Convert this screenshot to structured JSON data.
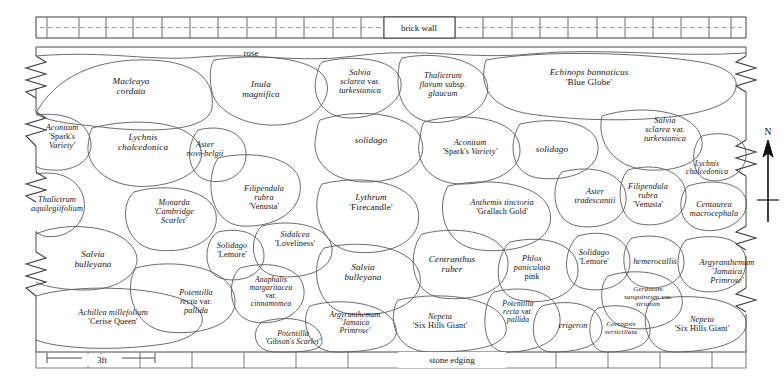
{
  "plan": {
    "title": "Herbaceous border planting plan",
    "annotations": {
      "wall": "brick wall",
      "rose": "rose",
      "edging": "stone edging"
    },
    "scale": {
      "label": "3ft"
    },
    "compass": {
      "label": "N"
    },
    "beds": [
      {
        "id": "aconitum-sparks-1",
        "genus": "Aconitum",
        "cultivar": "'Spark's Variety'",
        "lines": [
          "Aconitum",
          "'Spark's",
          "Variety'"
        ],
        "x": 62,
        "y": 137,
        "size": "sm"
      },
      {
        "id": "macleaya-cordata",
        "genus": "Macleaya cordata",
        "cultivar": "",
        "lines": [
          "Macleaya",
          "cordata"
        ],
        "x": 131,
        "y": 87,
        "size": ""
      },
      {
        "id": "lychnis-chalcedonica-1",
        "genus": "Lychnis chalcedonica",
        "cultivar": "",
        "lines": [
          "Lychnis",
          "chalcedonica"
        ],
        "x": 143,
        "y": 143,
        "size": ""
      },
      {
        "id": "thalictrum-aquilegiifolium",
        "genus": "Thalictrum aquilegiifolium",
        "cultivar": "",
        "lines": [
          "Thalictrum",
          "aquilegiifolium"
        ],
        "x": 57,
        "y": 205,
        "size": "sm"
      },
      {
        "id": "aster-novi-belgii",
        "genus": "Aster novi-belgii",
        "cultivar": "",
        "lines": [
          "Aster",
          "novi-belgii"
        ],
        "x": 205,
        "y": 150,
        "size": "sm"
      },
      {
        "id": "inula-magnifica",
        "genus": "Inula magnifica",
        "cultivar": "",
        "lines": [
          "Inula",
          "magnifica"
        ],
        "x": 261,
        "y": 90,
        "size": ""
      },
      {
        "id": "salvia-sclarea-turkestanica-1",
        "genus": "Salvia sclarea var. turkestanica",
        "cultivar": "",
        "lines": [
          "Salvia",
          "sclarea var.",
          "turkestanica"
        ],
        "x": 360,
        "y": 82,
        "size": "sm"
      },
      {
        "id": "thalictrum-flavum-glaucum",
        "genus": "Thalictrum flavum subsp. glaucum",
        "cultivar": "",
        "lines": [
          "Thalictrum",
          "flavum subsp.",
          "glaucum"
        ],
        "x": 443,
        "y": 85,
        "size": "sm"
      },
      {
        "id": "echinops-bannaticus",
        "genus": "Echinops bannaticus",
        "cultivar": "'Blue Globe'",
        "lines": [
          "Echinops bannaticus",
          "'Blue Globe'"
        ],
        "x": 589,
        "y": 78,
        "size": ""
      },
      {
        "id": "solidago-1",
        "genus": "solidago",
        "cultivar": "",
        "lines": [
          "solidago"
        ],
        "x": 371,
        "y": 141,
        "size": ""
      },
      {
        "id": "aconitum-sparks-2",
        "genus": "Aconitum",
        "cultivar": "'Spark's Variety'",
        "lines": [
          "Aconitum",
          "'Spark's Variety'"
        ],
        "x": 470,
        "y": 148,
        "size": "sm"
      },
      {
        "id": "solidago-2",
        "genus": "solidago",
        "cultivar": "",
        "lines": [
          "solidago"
        ],
        "x": 552,
        "y": 150,
        "size": ""
      },
      {
        "id": "salvia-sclarea-turkestanica-2",
        "genus": "Salvia sclarea var. turkestanica",
        "cultivar": "",
        "lines": [
          "Salvia",
          "sclarea var.",
          "turkestanica"
        ],
        "x": 665,
        "y": 130,
        "size": "sm"
      },
      {
        "id": "lychnis-chalcedonica-2",
        "genus": "Lychnis chalcedonica",
        "cultivar": "",
        "lines": [
          "Lychnis",
          "chalcedonica"
        ],
        "x": 707,
        "y": 168,
        "size": "xs"
      },
      {
        "id": "filipendula-venusta-1",
        "genus": "Filipendula rubra",
        "cultivar": "'Venusta'",
        "lines": [
          "Filipendula",
          "rubra",
          "'Venusta'"
        ],
        "x": 264,
        "y": 198,
        "size": "sm"
      },
      {
        "id": "monarda-cambridge-scarlet",
        "genus": "Monarda",
        "cultivar": "'Cambridge Scarlet'",
        "lines": [
          "Monarda",
          "'Cambridge",
          "Scarlet'"
        ],
        "x": 174,
        "y": 212,
        "size": "sm"
      },
      {
        "id": "lythrum-firecandle",
        "genus": "Lythrum",
        "cultivar": "'Firecandle'",
        "lines": [
          "Lythrum",
          "'Firecandle'"
        ],
        "x": 371,
        "y": 203,
        "size": ""
      },
      {
        "id": "anthemis-grallach-gold",
        "genus": "Anthemis tinctoria",
        "cultivar": "'Grallach Gold'",
        "lines": [
          "Anthemis tinctoria",
          "'Grallach Gold'"
        ],
        "x": 502,
        "y": 208,
        "size": "sm"
      },
      {
        "id": "aster-tradescantii",
        "genus": "Aster tradescantii",
        "cultivar": "",
        "lines": [
          "Aster",
          "tradescantii"
        ],
        "x": 595,
        "y": 197,
        "size": "sm"
      },
      {
        "id": "filipendula-venusta-2",
        "genus": "Filipendula rubra",
        "cultivar": "'Venusta'",
        "lines": [
          "Filipendula",
          "rubra",
          "'Venusta'"
        ],
        "x": 648,
        "y": 196,
        "size": "sm"
      },
      {
        "id": "centaurea-macrocephala",
        "genus": "Centaurea macrocephala",
        "cultivar": "",
        "lines": [
          "Centaurea",
          "macrocephala"
        ],
        "x": 714,
        "y": 210,
        "size": "sm"
      },
      {
        "id": "solidago-lemore-1",
        "genus": "Solidago",
        "cultivar": "'Lemore'",
        "lines": [
          "Solidago",
          "'Lemore'"
        ],
        "x": 232,
        "y": 251,
        "size": "sm"
      },
      {
        "id": "sidalcea-loveliness",
        "genus": "Sidalcea",
        "cultivar": "'Loveliness'",
        "lines": [
          "Sidalcea",
          "'Loveliness'"
        ],
        "x": 295,
        "y": 240,
        "size": "sm"
      },
      {
        "id": "salvia-bulleyana-1",
        "genus": "Salvia bulleyana",
        "cultivar": "",
        "lines": [
          "Salvia",
          "bulleyana"
        ],
        "x": 93,
        "y": 260,
        "size": ""
      },
      {
        "id": "salvia-bulleyana-2",
        "genus": "Salvia bulleyana",
        "cultivar": "",
        "lines": [
          "Salvia",
          "bulleyana"
        ],
        "x": 363,
        "y": 273,
        "size": ""
      },
      {
        "id": "centranthus-ruber",
        "genus": "Centranthus ruber",
        "cultivar": "",
        "lines": [
          "Centranthus",
          "ruber"
        ],
        "x": 452,
        "y": 265,
        "size": ""
      },
      {
        "id": "phlox-paniculata-pink",
        "genus": "Phlox paniculata",
        "cultivar": "pink",
        "lines": [
          "Phlox",
          "paniculata",
          "pink"
        ],
        "x": 532,
        "y": 268,
        "size": "sm"
      },
      {
        "id": "solidago-lemore-2",
        "genus": "Solidago",
        "cultivar": "'Lemore'",
        "lines": [
          "Solidago",
          "'Lemore'"
        ],
        "x": 594,
        "y": 258,
        "size": "sm"
      },
      {
        "id": "hemerocallis",
        "genus": "hemerocallis",
        "cultivar": "",
        "lines": [
          "hemerocallis"
        ],
        "x": 655,
        "y": 262,
        "size": "sm"
      },
      {
        "id": "argyranthemum-jamaica-primrose-2",
        "genus": "Argyranthemum",
        "cultivar": "'Jamaica Primrose'",
        "lines": [
          "Argyranthemum",
          "'Jamaica",
          "Primrose'"
        ],
        "x": 727,
        "y": 272,
        "size": "sm"
      },
      {
        "id": "anaphalis-margaritacea",
        "genus": "Anaphalis margaritacea var. cinnamomea",
        "cultivar": "",
        "lines": [
          "Anaphalis",
          "margaritacea",
          "var.",
          "cinnamomea"
        ],
        "x": 271,
        "y": 292,
        "size": "xs"
      },
      {
        "id": "potentilla-recta-pallida-1",
        "genus": "Potentilla recta var. pallida",
        "cultivar": "",
        "lines": [
          "Potentilla",
          "recta var.",
          "pallida"
        ],
        "x": 196,
        "y": 302,
        "size": "sm"
      },
      {
        "id": "achillea-cerise-queen",
        "genus": "Achillea millefolium",
        "cultivar": "'Cerise Queen'",
        "lines": [
          "Achillea millefolium",
          "'Cerise Queen'"
        ],
        "x": 113,
        "y": 318,
        "size": "sm"
      },
      {
        "id": "potentilla-gibsons-scarlet",
        "genus": "Potentilla",
        "cultivar": "'Gibson's Scarlet'",
        "lines": [
          "Potentilla",
          "'Gibson's Scarlet'"
        ],
        "x": 293,
        "y": 338,
        "size": "xs"
      },
      {
        "id": "argyranthemum-jamaica-primrose-1",
        "genus": "Argyranthemum",
        "cultivar": "'Jamaica Primrose'",
        "lines": [
          "Argyranthemum",
          "'Jamaica",
          "Primrose'"
        ],
        "x": 355,
        "y": 323,
        "size": "xs"
      },
      {
        "id": "nepeta-six-hills-giant-1",
        "genus": "Nepeta",
        "cultivar": "'Six Hills Giant'",
        "lines": [
          "Nepeta",
          "'Six Hills Giant'"
        ],
        "x": 440,
        "y": 322,
        "size": "sm"
      },
      {
        "id": "potentilla-recta-pallida-2",
        "genus": "Potentilla recta var. pallida",
        "cultivar": "",
        "lines": [
          "Potentilla",
          "recta var.",
          "pallida"
        ],
        "x": 518,
        "y": 312,
        "size": "xs"
      },
      {
        "id": "erigeron",
        "genus": "erigeron",
        "cultivar": "",
        "lines": [
          "erigeron"
        ],
        "x": 573,
        "y": 326,
        "size": "sm"
      },
      {
        "id": "geranium-sanguineum-striatum",
        "genus": "Geranium sanguineum var. striatum",
        "cultivar": "",
        "lines": [
          "Geranium",
          "sanguineum var.",
          "striatum"
        ],
        "x": 648,
        "y": 297,
        "size": "tiny"
      },
      {
        "id": "coreopsis-verticillata",
        "genus": "Coreopsis verticillata",
        "cultivar": "",
        "lines": [
          "Coreopsis",
          "verticillata"
        ],
        "x": 621,
        "y": 329,
        "size": "tiny"
      },
      {
        "id": "nepeta-six-hills-giant-2",
        "genus": "Nepeta",
        "cultivar": "'Six Hills Giant'",
        "lines": [
          "Nepeta",
          "'Six Hills Giant'"
        ],
        "x": 702,
        "y": 325,
        "size": "sm"
      }
    ]
  }
}
